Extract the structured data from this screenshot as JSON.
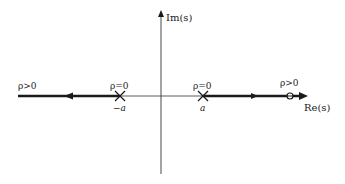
{
  "diagram": {
    "type": "root-locus",
    "axes": {
      "imag_label": "Im(s)",
      "real_label": "Re(s)"
    },
    "poles": [
      {
        "name": "neg-a",
        "label": "−a",
        "gain_label": "ρ=0"
      },
      {
        "name": "pos-a",
        "label": "a",
        "gain_label": "ρ=0"
      }
    ],
    "zero": {
      "gain_label": "ρ>0"
    },
    "left_branch": {
      "gain_label": "ρ>0"
    },
    "colors": {
      "line": "#1a1a1a",
      "background": "#ffffff"
    }
  }
}
